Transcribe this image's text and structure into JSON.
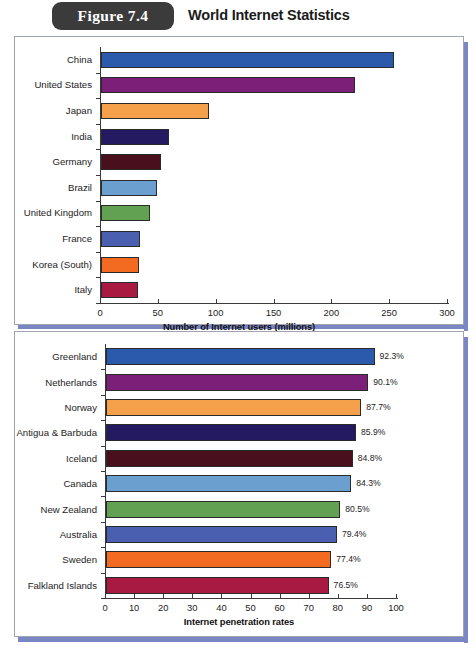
{
  "header": {
    "figure_tab": "Figure 7.4",
    "title": "World Internet Statistics"
  },
  "colors": {
    "palette": [
      "#2b5aad",
      "#7b1f79",
      "#f5a04b",
      "#241a62",
      "#4a0f1d",
      "#6a9fd0",
      "#63a152",
      "#4a5fb0",
      "#f26b21",
      "#a81a42"
    ],
    "panel_border": "#9fa4ad",
    "shadow": "#7b86c4",
    "tab_bg": "#3b3b3b"
  },
  "chart_data": [
    {
      "type": "bar",
      "orientation": "horizontal",
      "title": "",
      "xlabel": "Number of Internet users (millions)",
      "ylabel": "",
      "xlim": [
        0,
        300
      ],
      "xticks": [
        0,
        50,
        100,
        150,
        200,
        250,
        300
      ],
      "grid": false,
      "legend": "none",
      "categories": [
        "China",
        "United States",
        "Japan",
        "India",
        "Germany",
        "Brazil",
        "United Kingdom",
        "France",
        "Korea (South)",
        "Italy"
      ],
      "values": [
        253,
        220,
        93,
        59,
        52,
        48,
        42,
        34,
        33,
        32
      ],
      "value_labels": [
        "",
        "",
        "",
        "",
        "",
        "",
        "",
        "",
        "",
        ""
      ]
    },
    {
      "type": "bar",
      "orientation": "horizontal",
      "title": "",
      "xlabel": "Internet penetration rates",
      "ylabel": "",
      "xlim": [
        0,
        100
      ],
      "xticks": [
        0,
        10,
        20,
        30,
        40,
        50,
        60,
        70,
        80,
        90,
        100
      ],
      "grid": false,
      "legend": "none",
      "categories": [
        "Greenland",
        "Netherlands",
        "Norway",
        "Antigua & Barbuda",
        "Iceland",
        "Canada",
        "New Zealand",
        "Australia",
        "Sweden",
        "Falkland Islands"
      ],
      "values": [
        92.3,
        90.1,
        87.7,
        85.9,
        84.8,
        84.3,
        80.5,
        79.4,
        77.4,
        76.5
      ],
      "value_labels": [
        "92.3%",
        "90.1%",
        "87.7%",
        "85.9%",
        "84.8%",
        "84.3%",
        "80.5%",
        "79.4%",
        "77.4%",
        "76.5%"
      ]
    }
  ]
}
